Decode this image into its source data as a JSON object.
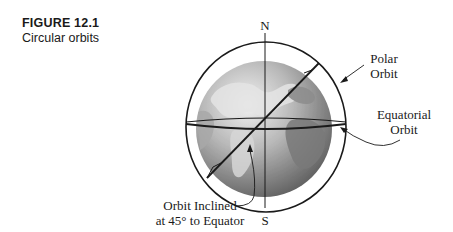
{
  "figure": {
    "number": "FIGURE 12.1",
    "title": "Circular orbits"
  },
  "diagram": {
    "poles": {
      "north": "N",
      "south": "S"
    },
    "labels": {
      "polar_line1": "Polar",
      "polar_line2": "Orbit",
      "equatorial_line1": "Equatorial",
      "equatorial_line2": "Orbit",
      "inclined_line1": "Orbit Inclined",
      "inclined_line2": "at 45° to Equator"
    },
    "colors": {
      "line": "#1a1a1a",
      "ocean_light": "#c8c8c8",
      "ocean_dark": "#6e6e6e",
      "land_light": "#e6e6e6",
      "land_dark": "#8a8a8a"
    }
  }
}
